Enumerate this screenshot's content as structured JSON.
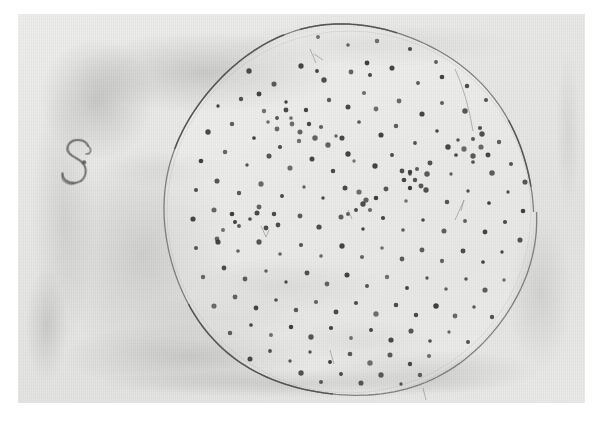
{
  "image": {
    "kind": "photograph",
    "subject": "petri-dish-colony-plate",
    "description": "Monochrome photographic print of a circular culture plate covered with small dark colony spots, handwritten label at left",
    "caption": ""
  },
  "print": {
    "border_color": "#ffffff",
    "paper_tone": "#e6e6e4",
    "border_left": 18,
    "border_top": 14,
    "photo_width": 567,
    "photo_height": 389
  },
  "annotation": {
    "label": "S",
    "label_style": "handwritten-ink",
    "label_color": "#5b5b5b",
    "x": 72,
    "y": 162
  },
  "plate": {
    "name": "culture-dish-rim",
    "center_x": 331,
    "center_y": 198,
    "radius": 186,
    "rim_color": "#6f6f6f",
    "rim_width": 1.3
  },
  "colony_data": {
    "type": "scatter",
    "title": "",
    "dot_color": "#3a3a3a",
    "dot_radius_mean": 2.2,
    "count": 232,
    "points": [
      [
        236,
        38
      ],
      [
        268,
        25
      ],
      [
        300,
        23
      ],
      [
        330,
        31
      ],
      [
        359,
        27
      ],
      [
        392,
        35
      ],
      [
        418,
        48
      ],
      [
        443,
        41
      ],
      [
        205,
        60
      ],
      [
        231,
        57
      ],
      [
        256,
        70
      ],
      [
        283,
        52
      ],
      [
        306,
        66
      ],
      [
        299,
        57
      ],
      [
        333,
        58
      ],
      [
        349,
        49
      ],
      [
        352,
        61
      ],
      [
        374,
        54
      ],
      [
        400,
        69
      ],
      [
        424,
        63
      ],
      [
        449,
        72
      ],
      [
        466,
        59
      ],
      [
        200,
        92
      ],
      [
        223,
        85
      ],
      [
        246,
        97
      ],
      [
        241,
        80
      ],
      [
        268,
        88
      ],
      [
        288,
        96
      ],
      [
        273,
        104
      ],
      [
        311,
        86
      ],
      [
        330,
        93
      ],
      [
        346,
        79
      ],
      [
        358,
        95
      ],
      [
        381,
        87
      ],
      [
        404,
        100
      ],
      [
        424,
        89
      ],
      [
        447,
        97
      ],
      [
        468,
        86
      ],
      [
        486,
        101
      ],
      [
        190,
        118
      ],
      [
        214,
        110
      ],
      [
        236,
        124
      ],
      [
        259,
        115
      ],
      [
        281,
        127
      ],
      [
        262,
        133
      ],
      [
        303,
        113
      ],
      [
        324,
        124
      ],
      [
        341,
        108
      ],
      [
        363,
        121
      ],
      [
        378,
        112
      ],
      [
        397,
        129
      ],
      [
        419,
        117
      ],
      [
        440,
        126
      ],
      [
        462,
        114
      ],
      [
        481,
        128
      ],
      [
        499,
        117
      ],
      [
        183,
        147
      ],
      [
        207,
        138
      ],
      [
        229,
        151
      ],
      [
        251,
        142
      ],
      [
        272,
        154
      ],
      [
        294,
        145
      ],
      [
        315,
        157
      ],
      [
        336,
        147
      ],
      [
        330,
        140
      ],
      [
        357,
        152
      ],
      [
        374,
        141
      ],
      [
        392,
        158
      ],
      [
        412,
        149
      ],
      [
        433,
        160
      ],
      [
        455,
        148
      ],
      [
        474,
        159
      ],
      [
        493,
        150
      ],
      [
        509,
        140
      ],
      [
        178,
        176
      ],
      [
        199,
        167
      ],
      [
        221,
        179
      ],
      [
        243,
        170
      ],
      [
        264,
        182
      ],
      [
        286,
        173
      ],
      [
        305,
        184
      ],
      [
        327,
        174
      ],
      [
        348,
        186
      ],
      [
        341,
        178
      ],
      [
        368,
        175
      ],
      [
        388,
        187
      ],
      [
        408,
        176
      ],
      [
        429,
        188
      ],
      [
        450,
        177
      ],
      [
        471,
        189
      ],
      [
        490,
        178
      ],
      [
        507,
        168
      ],
      [
        521,
        182
      ],
      [
        175,
        205
      ],
      [
        196,
        196
      ],
      [
        217,
        208
      ],
      [
        239,
        199
      ],
      [
        260,
        211
      ],
      [
        282,
        202
      ],
      [
        301,
        213
      ],
      [
        323,
        203
      ],
      [
        345,
        215
      ],
      [
        365,
        204
      ],
      [
        385,
        216
      ],
      [
        405,
        206
      ],
      [
        426,
        217
      ],
      [
        447,
        207
      ],
      [
        467,
        218
      ],
      [
        487,
        208
      ],
      [
        505,
        197
      ],
      [
        520,
        210
      ],
      [
        178,
        234
      ],
      [
        199,
        225
      ],
      [
        220,
        237
      ],
      [
        241,
        228
      ],
      [
        262,
        240
      ],
      [
        283,
        231
      ],
      [
        303,
        242
      ],
      [
        324,
        232
      ],
      [
        344,
        243
      ],
      [
        364,
        234
      ],
      [
        384,
        245
      ],
      [
        404,
        236
      ],
      [
        424,
        247
      ],
      [
        445,
        237
      ],
      [
        465,
        248
      ],
      [
        484,
        238
      ],
      [
        502,
        226
      ],
      [
        515,
        240
      ],
      [
        185,
        263
      ],
      [
        206,
        254
      ],
      [
        227,
        265
      ],
      [
        248,
        257
      ],
      [
        268,
        268
      ],
      [
        289,
        259
      ],
      [
        309,
        270
      ],
      [
        329,
        261
      ],
      [
        349,
        272
      ],
      [
        369,
        263
      ],
      [
        389,
        274
      ],
      [
        409,
        264
      ],
      [
        428,
        275
      ],
      [
        448,
        265
      ],
      [
        467,
        276
      ],
      [
        486,
        266
      ],
      [
        503,
        255
      ],
      [
        196,
        292
      ],
      [
        217,
        283
      ],
      [
        238,
        294
      ],
      [
        258,
        286
      ],
      [
        278,
        296
      ],
      [
        298,
        288
      ],
      [
        318,
        298
      ],
      [
        338,
        289
      ],
      [
        358,
        300
      ],
      [
        378,
        291
      ],
      [
        398,
        301
      ],
      [
        418,
        292
      ],
      [
        437,
        302
      ],
      [
        456,
        293
      ],
      [
        474,
        303
      ],
      [
        491,
        292
      ],
      [
        212,
        319
      ],
      [
        233,
        311
      ],
      [
        253,
        321
      ],
      [
        273,
        313
      ],
      [
        293,
        323
      ],
      [
        313,
        314
      ],
      [
        333,
        324
      ],
      [
        353,
        316
      ],
      [
        373,
        326
      ],
      [
        393,
        317
      ],
      [
        412,
        327
      ],
      [
        431,
        318
      ],
      [
        450,
        328
      ],
      [
        467,
        317
      ],
      [
        232,
        345
      ],
      [
        252,
        337
      ],
      [
        272,
        347
      ],
      [
        292,
        338
      ],
      [
        312,
        348
      ],
      [
        332,
        340
      ],
      [
        352,
        349
      ],
      [
        372,
        341
      ],
      [
        392,
        350
      ],
      [
        411,
        342
      ],
      [
        430,
        351
      ],
      [
        448,
        341
      ],
      [
        262,
        367
      ],
      [
        283,
        359
      ],
      [
        303,
        368
      ],
      [
        323,
        360
      ],
      [
        343,
        369
      ],
      [
        363,
        361
      ],
      [
        383,
        370
      ],
      [
        402,
        361
      ],
      [
        287,
        381
      ],
      [
        312,
        377
      ],
      [
        337,
        382
      ],
      [
        361,
        376
      ],
      [
        392,
        160
      ],
      [
        397,
        166
      ],
      [
        403,
        172
      ],
      [
        386,
        166
      ],
      [
        392,
        174
      ],
      [
        409,
        160
      ],
      [
        399,
        155
      ],
      [
        384,
        157
      ],
      [
        345,
        190
      ],
      [
        352,
        196
      ],
      [
        338,
        196
      ],
      [
        358,
        184
      ],
      [
        330,
        200
      ],
      [
        318,
        122
      ],
      [
        310,
        131
      ],
      [
        297,
        124
      ],
      [
        214,
        200
      ],
      [
        221,
        212
      ],
      [
        232,
        205
      ],
      [
        248,
        214
      ],
      [
        256,
        200
      ],
      [
        241,
        193
      ],
      [
        205,
        216
      ],
      [
        200,
        228
      ],
      [
        430,
        133
      ],
      [
        438,
        141
      ],
      [
        446,
        135
      ],
      [
        455,
        142
      ],
      [
        463,
        133
      ],
      [
        470,
        141
      ],
      [
        455,
        125
      ],
      [
        464,
        120
      ],
      [
        282,
        118
      ],
      [
        291,
        110
      ],
      [
        274,
        110
      ],
      [
        259,
        104
      ],
      [
        268,
        96
      ],
      [
        250,
        108
      ]
    ]
  }
}
